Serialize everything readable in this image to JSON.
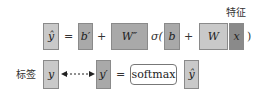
{
  "colors": {
    "light": "#c9c9c9",
    "mid": "#a9a9a9",
    "dark": "#8a8a8a",
    "text": "#333333"
  },
  "row1": {
    "y_hat": "ŷ",
    "equals": "=",
    "b_prime": "b′",
    "plus1": "+",
    "W_dprime": "W″",
    "sigma_open": "σ(",
    "b": "b",
    "plus2": "+",
    "W": "W",
    "x": "x",
    "close_paren": ")",
    "feature_label": "特征"
  },
  "row2": {
    "label_text": "标签",
    "y": "y",
    "y_prime": "y′",
    "equals": "=",
    "softmax": "softmax",
    "y_hat": "ŷ"
  }
}
